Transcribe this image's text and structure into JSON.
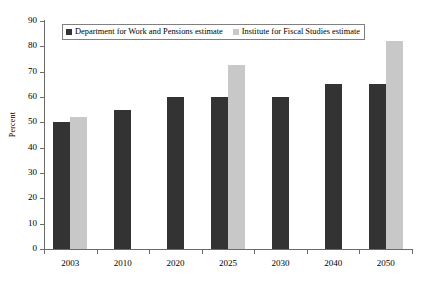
{
  "chart_data": {
    "type": "bar",
    "title": "",
    "subtitle": "",
    "xlabel": "",
    "ylabel": "Percent",
    "categories": [
      "2003",
      "2010",
      "2020",
      "2025",
      "2030",
      "2040",
      "2050"
    ],
    "series": [
      {
        "name": "Department for Work and Pensions estimate",
        "color": "#333333",
        "values": [
          50,
          55,
          60,
          60,
          60,
          65,
          65
        ]
      },
      {
        "name": "Institute for Fiscal Studies estimate",
        "color": "#c8c8c8",
        "values": [
          52,
          null,
          null,
          72.5,
          null,
          null,
          82
        ]
      }
    ],
    "ylim": [
      0,
      90
    ],
    "ytick_step": 10,
    "yticks": [
      "90",
      "80",
      "70",
      "60",
      "50",
      "40",
      "30",
      "20",
      "10",
      "0"
    ],
    "grid": false,
    "legend_position": "top-left-inside",
    "legend_entries": [
      "Department for Work and Pensions estimate",
      "Institute for Fiscal Studies estimate"
    ]
  }
}
